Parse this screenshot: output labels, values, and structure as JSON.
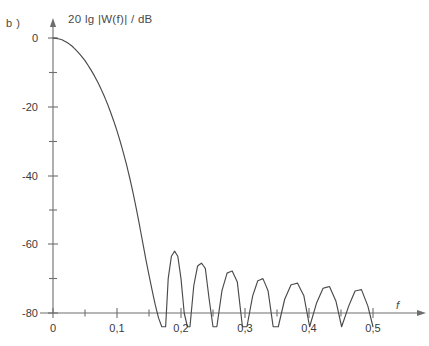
{
  "figure": {
    "panel_label": "b )",
    "axis_title": "20 lg |W(f)| / dB",
    "background_color": "#ffffff",
    "line_color": "#4a4a4a",
    "axis_color": "#6e6e6e"
  },
  "chart_data": {
    "type": "line",
    "title": "20 lg |W(f)| / dB",
    "xlabel": "f",
    "ylabel": "20 lg |W(f)| / dB",
    "xlim": [
      0,
      0.53
    ],
    "ylim": [
      -84,
      4
    ],
    "grid": false,
    "legend": null,
    "x_ticks": [
      0,
      0.1,
      0.2,
      0.3,
      0.4,
      0.5
    ],
    "x_tick_labels": [
      "0",
      "0,1",
      "0,2",
      "0,3",
      "0,4",
      "0,5"
    ],
    "x_minor_ticks": [
      0.05,
      0.15,
      0.25,
      0.35,
      0.45
    ],
    "y_ticks": [
      0,
      -20,
      -40,
      -60,
      -80
    ],
    "y_tick_labels": [
      "0",
      "-20",
      "-40",
      "-60",
      "-80"
    ],
    "y_minor_ticks": [
      -10,
      -30,
      -50,
      -70
    ],
    "annotations": [
      {
        "text": "b )",
        "x": 0.0,
        "y": 4.0
      },
      {
        "text": "f",
        "x": 0.53,
        "y": -80.0
      }
    ],
    "series": [
      {
        "name": "20 lg |W(f)|",
        "description": "Main lobe decaying from 0 dB at f=0 to first null near f=0.176, followed by six side lobes between -62 dB and -73 dB, last null at f=0.5",
        "x": [
          0.0,
          0.005,
          0.01,
          0.015,
          0.02,
          0.025,
          0.03,
          0.035,
          0.04,
          0.045,
          0.05,
          0.055,
          0.06,
          0.065,
          0.07,
          0.075,
          0.08,
          0.085,
          0.09,
          0.095,
          0.1,
          0.105,
          0.11,
          0.115,
          0.12,
          0.125,
          0.13,
          0.135,
          0.14,
          0.145,
          0.15,
          0.155,
          0.16,
          0.165,
          0.17,
          0.173,
          0.176,
          0.18,
          0.185,
          0.19,
          0.195,
          0.2,
          0.205,
          0.21,
          0.214,
          0.22,
          0.226,
          0.232,
          0.238,
          0.244,
          0.25,
          0.256,
          0.264,
          0.272,
          0.28,
          0.288,
          0.296,
          0.303,
          0.312,
          0.32,
          0.328,
          0.336,
          0.344,
          0.352,
          0.362,
          0.372,
          0.382,
          0.392,
          0.401,
          0.412,
          0.422,
          0.432,
          0.442,
          0.451,
          0.462,
          0.472,
          0.482,
          0.492,
          0.5
        ],
        "y": [
          0.0,
          -0.1,
          -0.3,
          -0.6,
          -1.1,
          -1.7,
          -2.4,
          -3.3,
          -4.3,
          -5.4,
          -6.6,
          -8.0,
          -9.5,
          -11.1,
          -12.9,
          -14.8,
          -16.9,
          -19.1,
          -21.6,
          -24.2,
          -27.0,
          -30.1,
          -33.4,
          -36.9,
          -40.8,
          -45.0,
          -49.5,
          -54.3,
          -59.3,
          -64.3,
          -69.0,
          -73.5,
          -77.8,
          -81.5,
          -84.0,
          -84.0,
          -84.0,
          -70.0,
          -63.5,
          -62.0,
          -63.5,
          -70.0,
          -80.0,
          -84.0,
          -84.0,
          -72.0,
          -66.3,
          -65.5,
          -67.0,
          -76.0,
          -84.0,
          -84.0,
          -73.5,
          -68.4,
          -67.8,
          -71.0,
          -84.0,
          -84.0,
          -75.0,
          -70.6,
          -70.0,
          -73.5,
          -84.0,
          -84.0,
          -76.0,
          -71.8,
          -71.3,
          -75.0,
          -84.0,
          -77.0,
          -72.8,
          -72.3,
          -76.5,
          -84.0,
          -78.0,
          -73.6,
          -73.2,
          -78.0,
          -84.0
        ],
        "side_lobe_peaks": [
          {
            "f": 0.19,
            "level_db": -62
          },
          {
            "f": 0.232,
            "level_db": -65.5
          },
          {
            "f": 0.28,
            "level_db": -67.8
          },
          {
            "f": 0.328,
            "level_db": -70.0
          },
          {
            "f": 0.382,
            "level_db": -71.3
          },
          {
            "f": 0.432,
            "level_db": -72.3
          }
        ],
        "nulls_f": [
          0.176,
          0.214,
          0.256,
          0.303,
          0.352,
          0.401,
          0.451,
          0.5
        ]
      }
    ]
  }
}
